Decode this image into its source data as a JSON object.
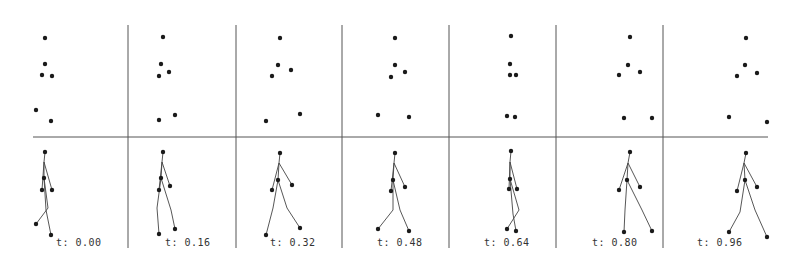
{
  "figure": {
    "line_color": "#555555",
    "dot_color": "#1a1a1a",
    "horizontal_divider_y": 137,
    "horizontal_divider_x": [
      33,
      768
    ],
    "vertical_dividers_x": [
      128,
      236,
      342,
      449,
      556,
      663
    ],
    "vertical_divider_y": [
      25,
      248
    ]
  },
  "frames": [
    {
      "time_label": "t: 0.00",
      "label_x": 56,
      "dots": [
        [
          45,
          38
        ],
        [
          45,
          64
        ],
        [
          42,
          75
        ],
        [
          52,
          76
        ],
        [
          36,
          110
        ],
        [
          51,
          121
        ]
      ],
      "skeleton": {
        "head": [
          45,
          152
        ],
        "neck": [
          44,
          162
        ],
        "hip": [
          44,
          178
        ],
        "l_hand": [
          42,
          190
        ],
        "r_hand": [
          52,
          190
        ],
        "l_knee": [
          48,
          208
        ],
        "l_foot": [
          36,
          224
        ],
        "r_knee": [
          46,
          210
        ],
        "r_foot": [
          51,
          235
        ]
      }
    },
    {
      "time_label": "t: 0.16",
      "label_x": 165,
      "dots": [
        [
          163,
          37
        ],
        [
          161,
          64
        ],
        [
          169,
          72
        ],
        [
          159,
          76
        ],
        [
          159,
          120
        ],
        [
          175,
          115
        ]
      ],
      "skeleton": {
        "head": [
          163,
          152
        ],
        "neck": [
          162,
          162
        ],
        "hip": [
          161,
          178
        ],
        "l_hand": [
          159,
          190
        ],
        "r_hand": [
          170,
          186
        ],
        "l_knee": [
          157,
          208
        ],
        "l_foot": [
          159,
          234
        ],
        "r_knee": [
          171,
          210
        ],
        "r_foot": [
          175,
          229
        ]
      }
    },
    {
      "time_label": "t: 0.32",
      "label_x": 270,
      "dots": [
        [
          280,
          38
        ],
        [
          278,
          65
        ],
        [
          291,
          70
        ],
        [
          272,
          76
        ],
        [
          266,
          121
        ],
        [
          300,
          114
        ]
      ],
      "skeleton": {
        "head": [
          280,
          153
        ],
        "neck": [
          279,
          163
        ],
        "hip": [
          278,
          180
        ],
        "l_hand": [
          272,
          190
        ],
        "r_hand": [
          292,
          185
        ],
        "l_knee": [
          273,
          208
        ],
        "l_foot": [
          266,
          235
        ],
        "r_knee": [
          287,
          208
        ],
        "r_foot": [
          300,
          228
        ]
      }
    },
    {
      "time_label": "t: 0.48",
      "label_x": 377,
      "dots": [
        [
          395,
          38
        ],
        [
          395,
          65
        ],
        [
          405,
          72
        ],
        [
          391,
          77
        ],
        [
          378,
          115
        ],
        [
          409,
          117
        ]
      ],
      "skeleton": {
        "head": [
          395,
          153
        ],
        "neck": [
          394,
          163
        ],
        "hip": [
          393,
          180
        ],
        "l_hand": [
          391,
          191
        ],
        "r_hand": [
          405,
          187
        ],
        "l_knee": [
          393,
          210
        ],
        "l_foot": [
          378,
          229
        ],
        "r_knee": [
          400,
          210
        ],
        "r_foot": [
          409,
          231
        ]
      }
    },
    {
      "time_label": "t: 0.64",
      "label_x": 484,
      "dots": [
        [
          511,
          36
        ],
        [
          510,
          64
        ],
        [
          510,
          75
        ],
        [
          516,
          75
        ],
        [
          507,
          116
        ],
        [
          515,
          117
        ]
      ],
      "skeleton": {
        "head": [
          511,
          151
        ],
        "neck": [
          510,
          162
        ],
        "hip": [
          510,
          179
        ],
        "l_hand": [
          509,
          189
        ],
        "r_hand": [
          517,
          189
        ],
        "l_knee": [
          519,
          210
        ],
        "l_foot": [
          507,
          229
        ],
        "r_knee": [
          513,
          214
        ],
        "r_foot": [
          516,
          231
        ]
      }
    },
    {
      "time_label": "t: 0.80",
      "label_x": 592,
      "dots": [
        [
          630,
          37
        ],
        [
          628,
          65
        ],
        [
          640,
          72
        ],
        [
          619,
          75
        ],
        [
          624,
          118
        ],
        [
          652,
          118
        ]
      ],
      "skeleton": {
        "head": [
          630,
          152
        ],
        "neck": [
          628,
          163
        ],
        "hip": [
          627,
          180
        ],
        "l_hand": [
          619,
          190
        ],
        "r_hand": [
          640,
          187
        ],
        "l_knee": [
          625,
          210
        ],
        "l_foot": [
          624,
          232
        ],
        "r_knee": [
          642,
          210
        ],
        "r_foot": [
          652,
          231
        ]
      }
    },
    {
      "time_label": "t: 0.96",
      "label_x": 697,
      "dots": [
        [
          746,
          38
        ],
        [
          745,
          65
        ],
        [
          757,
          73
        ],
        [
          737,
          76
        ],
        [
          729,
          117
        ],
        [
          767,
          122
        ]
      ],
      "skeleton": {
        "head": [
          746,
          153
        ],
        "neck": [
          744,
          163
        ],
        "hip": [
          745,
          180
        ],
        "l_hand": [
          737,
          191
        ],
        "r_hand": [
          757,
          187
        ],
        "l_knee": [
          740,
          212
        ],
        "l_foot": [
          729,
          232
        ],
        "r_knee": [
          755,
          210
        ],
        "r_foot": [
          767,
          237
        ]
      }
    }
  ]
}
